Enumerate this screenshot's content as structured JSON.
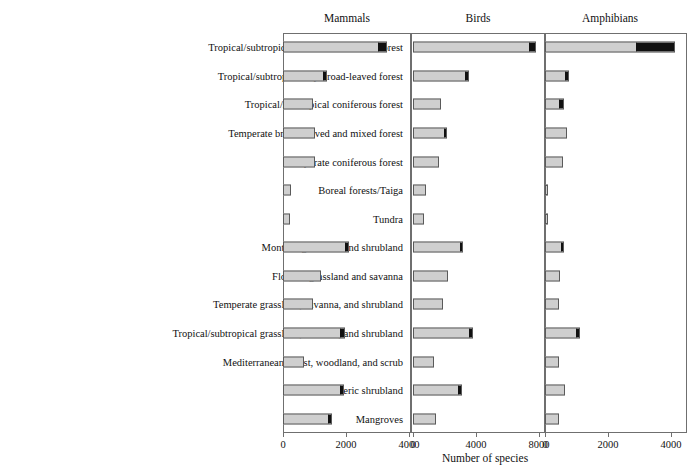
{
  "figure": {
    "axis_title": "Number of species",
    "categories": [
      "Tropical/subtropical moist broad-leaved forest",
      "Tropical/subtropical dry broad-leaved forest",
      "Tropical/subtropical coniferous forest",
      "Temperate broad-leaved and mixed forest",
      "Temperate coniferous forest",
      "Boreal forests/Taiga",
      "Tundra",
      "Montane grassland and shrubland",
      "Flooded grassland and savanna",
      "Temperate grassland, savanna, and shrubland",
      "Tropical/subtropical grassland, savanna, and shrubland",
      "Mediterranean forest, woodland, and scrub",
      "Desert and xeric shrubland",
      "Mangroves"
    ],
    "panels": [
      {
        "label": "Mammals",
        "xmin": 0,
        "xmax": 4200,
        "ticks": [
          0,
          2000,
          4000
        ],
        "tick_labels": [
          "0",
          "2000",
          "4000"
        ]
      },
      {
        "label": "Birds",
        "xmin": 0,
        "xmax": 8700,
        "ticks": [
          0,
          4000,
          8000
        ],
        "tick_labels": [
          "0",
          "4000",
          "8000"
        ]
      },
      {
        "label": "Amphibians",
        "xmin": 0,
        "xmax": 4500,
        "ticks": [
          0,
          2000,
          4000
        ],
        "tick_labels": [
          "0",
          "2000",
          "4000"
        ]
      }
    ]
  },
  "chart_data": {
    "type": "bar",
    "title": "",
    "xlabel": "Number of species",
    "ylabel": "",
    "orientation": "horizontal",
    "grid": false,
    "legend": null,
    "panel_note": "Each panel has its own x-axis scale; the dark segment at the end of each bar is the threatened portion of the total.",
    "categories": [
      "Tropical/subtropical moist broad-leaved forest",
      "Tropical/subtropical dry broad-leaved forest",
      "Tropical/subtropical coniferous forest",
      "Temperate broad-leaved and mixed forest",
      "Temperate coniferous forest",
      "Boreal forests/Taiga",
      "Tundra",
      "Montane grassland and shrubland",
      "Flooded grassland and savanna",
      "Temperate grassland, savanna, and shrubland",
      "Tropical/subtropical grassland, savanna, and shrubland",
      "Mediterranean forest, woodland, and scrub",
      "Desert and xeric shrubland",
      "Mangroves"
    ],
    "panels": [
      {
        "name": "Mammals",
        "xlim": [
          0,
          4200
        ],
        "xticks": [
          0,
          2000,
          4000
        ],
        "series": [
          {
            "name": "total",
            "values": [
              3300,
              1400,
              950,
              1020,
              1030,
              240,
              230,
              2100,
              1200,
              960,
              1960,
              680,
              1940,
              1540
            ]
          },
          {
            "name": "threatened",
            "values": [
              3060,
              1310,
              950,
              1020,
              1030,
              240,
              230,
              2000,
              1200,
              960,
              1850,
              680,
              1850,
              1460
            ]
          }
        ]
      },
      {
        "name": "Birds",
        "xlim": [
          0,
          8700
        ],
        "xticks": [
          0,
          4000,
          8000
        ],
        "series": [
          {
            "name": "total",
            "values": [
              7800,
              3550,
              1750,
              2180,
              1630,
              830,
              700,
              3200,
              2220,
              1900,
              3800,
              1350,
              3100,
              1450
            ]
          },
          {
            "name": "threatened",
            "values": [
              7400,
              3400,
              1750,
              2080,
              1630,
              830,
              700,
              3090,
              2220,
              1900,
              3620,
              1350,
              2990,
              1450
            ]
          }
        ]
      },
      {
        "name": "Amphibians",
        "xlim": [
          0,
          4500
        ],
        "xticks": [
          0,
          2000,
          4000
        ],
        "series": [
          {
            "name": "total",
            "values": [
              4120,
              760,
              610,
              700,
              560,
              70,
              60,
              610,
              470,
              430,
              1110,
              450,
              620,
              450
            ]
          },
          {
            "name": "threatened",
            "values": [
              2920,
              680,
              490,
              700,
              560,
              70,
              60,
              540,
              470,
              430,
              1020,
              450,
              620,
              450
            ]
          }
        ]
      }
    ]
  },
  "style": {
    "bar_fill": "#cfcfcf",
    "bar_threat_fill": "#111111",
    "bar_stroke": "#5a5a5a",
    "frame_stroke": "#6f6f6f",
    "text_color": "#111111"
  }
}
